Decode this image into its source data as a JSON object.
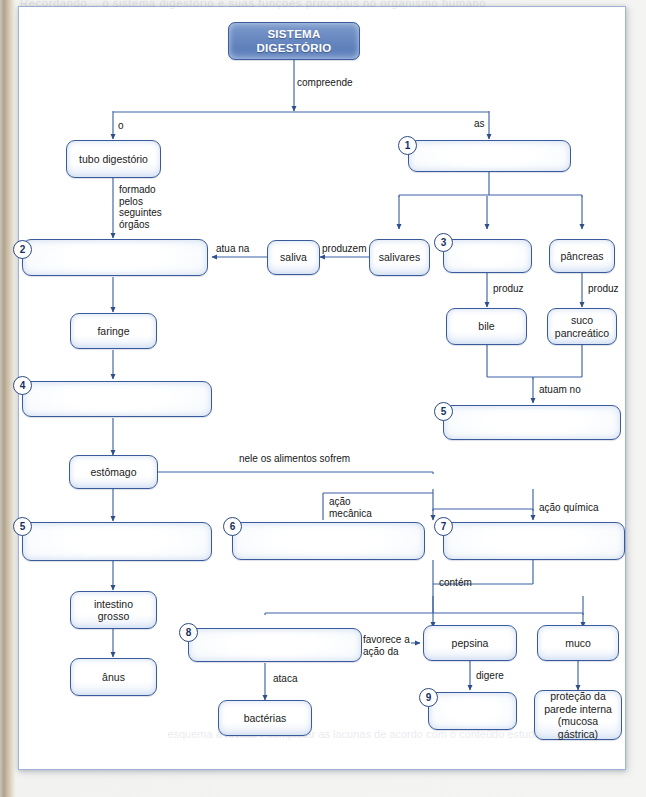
{
  "page": {
    "ghost_text_top": "Recordando... o sistema digestório e suas funções principais no organismo humano",
    "ghost_text_bottom": "esquema  a  revisar  /  completar  as  lacunas\nde acordo com o conteúdo estudado"
  },
  "colors": {
    "title_box_fill": "#6b8bc2",
    "box_border": "#3a5b9b",
    "box_fill_light": "#ffffff",
    "box_fill_edge": "#cfdcf0",
    "connector": "#3a5b9b",
    "page_border": "#9fb4d4",
    "page_bg": "#ffffff",
    "scan_bg": "#f2f2f0",
    "spine": "#b0a38a"
  },
  "diagram": {
    "root": {
      "label": "SISTEMA\nDIGESTÓRIO",
      "line1": "SISTEMA",
      "line2": "DIGESTÓRIO"
    },
    "nodes": [
      {
        "id": "tubo",
        "number": null,
        "label": "tubo digestório",
        "empty": false
      },
      {
        "id": "n1",
        "number": "1",
        "label": "",
        "empty": true
      },
      {
        "id": "n2",
        "number": "2",
        "label": "",
        "empty": true
      },
      {
        "id": "saliva",
        "number": null,
        "label": "saliva",
        "empty": false
      },
      {
        "id": "salivares",
        "number": null,
        "label": "salivares",
        "empty": false
      },
      {
        "id": "n3",
        "number": "3",
        "label": "",
        "empty": true
      },
      {
        "id": "pancreas",
        "number": null,
        "label": "pâncreas",
        "empty": false
      },
      {
        "id": "bile",
        "number": null,
        "label": "bile",
        "empty": false
      },
      {
        "id": "suco",
        "number": null,
        "label": "suco\npancreático",
        "empty": false
      },
      {
        "id": "faringe",
        "number": null,
        "label": "faringe",
        "empty": false
      },
      {
        "id": "n4",
        "number": "4",
        "label": "",
        "empty": true
      },
      {
        "id": "n5right",
        "number": "5",
        "label": "",
        "empty": true
      },
      {
        "id": "estomago",
        "number": null,
        "label": "estômago",
        "empty": false
      },
      {
        "id": "n5left",
        "number": "5",
        "label": "",
        "empty": true
      },
      {
        "id": "n6",
        "number": "6",
        "label": "",
        "empty": true
      },
      {
        "id": "n7",
        "number": "7",
        "label": "",
        "empty": true
      },
      {
        "id": "intestino",
        "number": null,
        "label": "intestino\ngrosso",
        "empty": false
      },
      {
        "id": "anus",
        "number": null,
        "label": "ânus",
        "empty": false
      },
      {
        "id": "n8",
        "number": "8",
        "label": "",
        "empty": true
      },
      {
        "id": "pepsina",
        "number": null,
        "label": "pepsina",
        "empty": false
      },
      {
        "id": "muco",
        "number": null,
        "label": "muco",
        "empty": false
      },
      {
        "id": "bacterias",
        "number": null,
        "label": "bactérias",
        "empty": false
      },
      {
        "id": "n9",
        "number": "9",
        "label": "",
        "empty": true
      },
      {
        "id": "protecao",
        "number": null,
        "label": "proteção da\nparede interna\n(mucosa gástrica)",
        "empty": false
      }
    ],
    "node_text": {
      "tubo": "tubo digestório",
      "saliva": "saliva",
      "salivares": "salivares",
      "pancreas": "pâncreas",
      "bile": "bile",
      "suco_l1": "suco",
      "suco_l2": "pancreático",
      "faringe": "faringe",
      "estomago": "estômago",
      "intestino_l1": "intestino",
      "intestino_l2": "grosso",
      "anus": "ânus",
      "pepsina": "pepsina",
      "muco": "muco",
      "bacterias": "bactérias",
      "protecao_l1": "proteção da",
      "protecao_l2": "parede interna",
      "protecao_l3": "(mucosa gástrica)"
    },
    "numbers": {
      "n1": "1",
      "n2": "2",
      "n3": "3",
      "n4": "4",
      "n5right": "5",
      "n5left": "5",
      "n6": "6",
      "n7": "7",
      "n8": "8",
      "n9": "9"
    },
    "edge_labels": {
      "compreende": "compreende",
      "o": "o",
      "as": "as",
      "formado_pelos_seguintes_orgaos": "formado\npelos\nseguintes\nórgãos",
      "atua_na": "atua na",
      "produzem": "produzem",
      "produz_bile": "produz",
      "produz_suco": "produz",
      "atuam_no": "atuam no",
      "nele_os_alimentos_sofrem": "nele os alimentos sofrem",
      "acao_mecanica": "ação\nmecânica",
      "acao_quimica": "ação química",
      "contem": "contém",
      "favorece_a_acao_da": "favorece a\nação da",
      "ataca": "ataca",
      "digere": "digere"
    }
  }
}
